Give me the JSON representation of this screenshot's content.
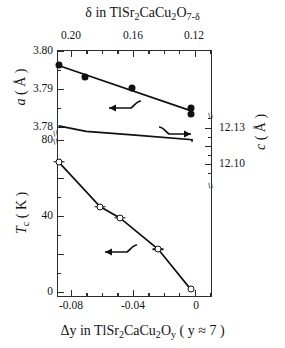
{
  "figure": {
    "top_title": {
      "pre": "δ in TlSr",
      "s1": "2",
      "m1": "CaCu",
      "s2": "2",
      "m2": "O",
      "s3": "7-δ"
    },
    "bottom_title": {
      "pre": "Δy in TlSr",
      "s1": "2",
      "m1": "CaCu",
      "s2": "2",
      "m2": "O",
      "s3": "y",
      "post": " ( y ≈ 7 )"
    },
    "background_color": "#ffffff",
    "axis_color": "#2b2b2b",
    "marker_color": "#101010"
  },
  "axes": {
    "top": {
      "label": "δ in TlSr2CaCu2O7-δ",
      "tick_labels": [
        "0.20",
        "0.16",
        "0.12"
      ],
      "tick_values": [
        0.2,
        0.16,
        0.12
      ],
      "range": [
        0.212,
        0.1115
      ],
      "minor_ticks": 3
    },
    "bottom": {
      "label": "Δy in TlSr2CaCu2O_y ( y ≈ 7 )",
      "tick_labels": [
        "-0.08",
        "-0.04",
        "0"
      ],
      "tick_values": [
        -0.08,
        -0.04,
        0
      ],
      "range": [
        -0.0925,
        0.0085
      ],
      "minor_ticks": 3
    },
    "left_upper": {
      "label": "a (Å)",
      "tick_labels": [
        "3.80",
        "3.79",
        "3.78"
      ],
      "tick_values": [
        3.8,
        3.79,
        3.78
      ],
      "range": [
        3.7775,
        3.8005
      ]
    },
    "left_lower": {
      "label": "Tc (K)",
      "tick_labels": [
        "80",
        "40",
        "0"
      ],
      "tick_values": [
        80,
        40,
        0
      ],
      "range": [
        -2,
        84
      ]
    },
    "right": {
      "label": "c (Å)",
      "tick_labels": [
        "12.13",
        "12.10"
      ],
      "tick_values": [
        12.13,
        12.1
      ],
      "range": [
        12.088,
        12.142
      ]
    },
    "break_marker": "≈"
  },
  "annotations": [
    {
      "name": "arrow-a-left",
      "symbol": "←",
      "note": "points left to a-axis"
    },
    {
      "name": "arrow-c-right",
      "symbol": "→",
      "note": "points right to c-axis"
    },
    {
      "name": "arrow-tc-left",
      "symbol": "←",
      "note": "points left to Tc-axis"
    }
  ],
  "chart_data": {
    "type": "scatter",
    "title": "δ in TlSr2CaCu2O7-δ",
    "xlabel": "Δy in TlSr2CaCu2Oy ( y ≈ 7 )",
    "ylabel": "a (Å) / Tc (K)",
    "ylabel_right": "c (Å)",
    "xlim": [
      -0.0925,
      0.0085
    ],
    "ylim_a": [
      3.7775,
      3.8005
    ],
    "ylim_tc": [
      -2,
      84
    ],
    "ylim_c": [
      12.088,
      12.142
    ],
    "grid": false,
    "legend": "none",
    "series": [
      {
        "name": "a-axis lattice parameter",
        "marker": "filled-circle",
        "axis": "left-upper",
        "units": "Å",
        "x": [
          -0.0915,
          -0.0745,
          -0.0435,
          -0.0055,
          -0.0055
        ],
        "y": [
          3.7963,
          3.7931,
          3.7903,
          3.7849,
          3.7833
        ],
        "connected": true,
        "fit_line": {
          "x": [
            -0.0915,
            -0.0055
          ],
          "y": [
            3.7962,
            3.7843
          ]
        }
      },
      {
        "name": "c-axis lattice parameter",
        "marker": "filled-triangle",
        "axis": "right",
        "units": "Å",
        "x": [
          -0.0915,
          -0.0735,
          -0.0435,
          -0.0045,
          -0.0045
        ],
        "y": [
          12.1318,
          12.1272,
          12.1242,
          12.1202,
          12.1185
        ],
        "connected": true
      },
      {
        "name": "superconducting transition temperature",
        "marker": "open-circle",
        "axis": "left-lower",
        "units": "K",
        "x": [
          -0.0915,
          -0.0645,
          -0.0515,
          -0.0265,
          -0.0055
        ],
        "y": [
          68.5,
          45.0,
          39.0,
          22.5,
          1.5
        ],
        "errors": [
          3.0,
          2.5,
          2.5,
          2.5,
          0.0
        ],
        "connected": true
      }
    ]
  }
}
